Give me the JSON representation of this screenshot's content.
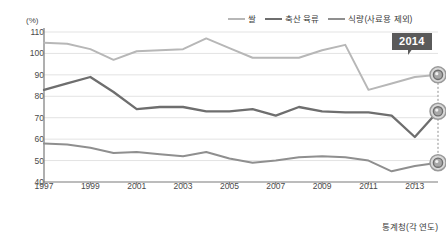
{
  "axis": {
    "unit_label": "(%)",
    "y_ticks": [
      110,
      100,
      90,
      80,
      70,
      60,
      50,
      40
    ],
    "x_ticks": [
      "1997",
      "1999",
      "2001",
      "2003",
      "2005",
      "2007",
      "2009",
      "2011",
      "2013"
    ]
  },
  "annotation": {
    "badge_label": "2014",
    "source_note": "통계청(각 연도)"
  },
  "colors": {
    "rice": "#b7b7b7",
    "livestock": "#6e6e6e",
    "food_grain": "#8f8f8f",
    "badge_bg": "#5a5a5a",
    "grid": "#e3e3e3",
    "axis": "#7a7a7a",
    "text": "#3b3b3b"
  },
  "chart_data": {
    "type": "line",
    "title": "",
    "xlabel": "",
    "ylabel": "(%)",
    "ylim": [
      40,
      110
    ],
    "xlim": [
      1997,
      2014
    ],
    "grid": true,
    "legend_position": "top-right",
    "x": [
      1997,
      1998,
      1999,
      2000,
      2001,
      2002,
      2003,
      2004,
      2005,
      2006,
      2007,
      2008,
      2009,
      2010,
      2011,
      2012,
      2013,
      2014
    ],
    "series": [
      {
        "name": "쌀",
        "color": "#b7b7b7",
        "values": [
          105,
          104.5,
          102,
          97,
          101,
          101.5,
          102,
          107,
          102.5,
          98,
          98,
          98,
          101.5,
          104,
          83,
          86,
          89,
          90
        ]
      },
      {
        "name": "축산 육류",
        "color": "#6e6e6e",
        "values": [
          83,
          86,
          89,
          82,
          74,
          75,
          75,
          73,
          73,
          74,
          71,
          75,
          73,
          72.5,
          72.5,
          71,
          61,
          73
        ]
      },
      {
        "name": "식량(사료용 제외)",
        "color": "#8f8f8f",
        "values": [
          58,
          57.5,
          56,
          53.5,
          54,
          53,
          52,
          54,
          51,
          49,
          50,
          51.5,
          52,
          51.5,
          50,
          45,
          47.5,
          49
        ]
      }
    ]
  }
}
